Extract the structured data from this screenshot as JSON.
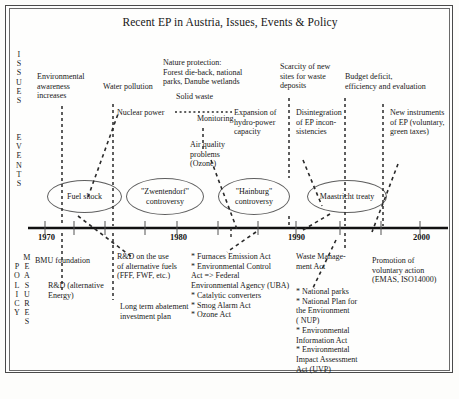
{
  "title": "Recent EP in Austria, Issues, Events & Policy",
  "bands": {
    "issues_label": "ISSUES",
    "events_label": "EVENTS",
    "policy_label": "POLICY",
    "measures_label": "MEASURES"
  },
  "issues": [
    {
      "id": "environmental-awareness",
      "text": "Environmental\nawareness\nincreases"
    },
    {
      "id": "water-pollution",
      "text": "Water pollution"
    },
    {
      "id": "nature-protection",
      "text": "Nature protection:\nForest die-back, national\nparks, Danube wetlands"
    },
    {
      "id": "solid-waste",
      "text": "Solid waste"
    },
    {
      "id": "scarcity-of-waste-sites",
      "text": "Scarcity of new\nsites for waste\ndeposits"
    },
    {
      "id": "budget-deficit",
      "text": "Budget deficit,\nefficiency and evaluation"
    },
    {
      "id": "nuclear-power",
      "text": "Nuclear power"
    },
    {
      "id": "monitoring",
      "text": "Monitoring"
    },
    {
      "id": "expansion-hydro-power",
      "text": "Expansion of\nhydro-power\ncapacity"
    },
    {
      "id": "air-quality-problems",
      "text": "Air quality\nproblems\n(Ozone)"
    },
    {
      "id": "disintegration-of-ep",
      "text": "Disintegration\nof EP incon-\nsistencies"
    },
    {
      "id": "new-instruments-of-ep",
      "text": "New instruments\nof EP (voluntary,\ngreen taxes)"
    }
  ],
  "events": [
    {
      "id": "fuel-shock",
      "text": "Fuel shock"
    },
    {
      "id": "zwentendorf-controversy",
      "text": "\"Zwentendorf\"\ncontroversy"
    },
    {
      "id": "hainburg-controversy",
      "text": "\"Hainburg\"\ncontroversy"
    },
    {
      "id": "maastricht-treaty",
      "text": "Maastricht treaty"
    }
  ],
  "timeline": {
    "years": [
      "1970",
      "1980",
      "1990",
      "2000"
    ]
  },
  "policies": [
    {
      "id": "bmu-foundation",
      "text": "BMU foundation"
    },
    {
      "id": "rd-alternative-energy",
      "text": "R&D (alternative\nEnergy)"
    },
    {
      "id": "rd-alternative-fuels",
      "text": "R&D on the use\nof alternative fuels\n(FFF, FWF, etc.)"
    },
    {
      "id": "long-term-abatement",
      "text": "Long term abatement\ninvestment plan"
    },
    {
      "id": "policy-list-1980s",
      "text": "* Furnaces  Emission Act\n* Environmental Control\n   Act => Federal\n   Environmental Agency (UBA)\n* Catalytic converters\n* Smog  Alarm Act\n* Ozone  Act"
    },
    {
      "id": "waste-management-act",
      "text": "Waste Manage-\nment Act"
    },
    {
      "id": "policy-list-1990s",
      "text": "* National parks\n* National Plan for\n   the Environment\n  ( NUP)\n* Environmental\n   Information Act\n* Environmental\n   Impact Assessment\n   Act  (UVP)"
    },
    {
      "id": "promotion-voluntary-action",
      "text": "Promotion of\nvoluntary action\n(EMAS, ISO14000)"
    }
  ],
  "colors": {
    "ink": "#181818",
    "axis": "#111111",
    "dashed": "#2a2a2a"
  }
}
